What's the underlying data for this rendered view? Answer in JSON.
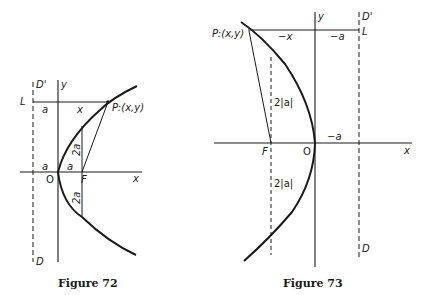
{
  "figures": [
    {
      "caption": "Figure 72",
      "labels": {
        "directrix_top": "D'",
        "directrix_bottom": "D",
        "y_axis": "y",
        "x_axis": "x",
        "L": "L",
        "point": "P:(x,y)",
        "seg_a_top": "a",
        "seg_x_top": "x",
        "seg_a_left": "a",
        "seg_a_right": "a",
        "origin": "O",
        "focus": "F",
        "chord_upper": "2a",
        "chord_lower": "2a"
      }
    },
    {
      "caption": "Figure 73",
      "labels": {
        "directrix_top": "D'",
        "directrix_bottom": "D",
        "y_axis": "y",
        "x_axis": "x",
        "L": "L",
        "point": "P:(x,y)",
        "seg_neg_x": "−x",
        "seg_neg_a_top": "−a",
        "seg_neg_a_axis": "−a",
        "origin": "O",
        "focus": "F",
        "chord_upper": "2|a|",
        "chord_lower": "2|a|"
      }
    }
  ],
  "colors": {
    "ink": "#1a1a1a",
    "background": "#ffffff"
  }
}
